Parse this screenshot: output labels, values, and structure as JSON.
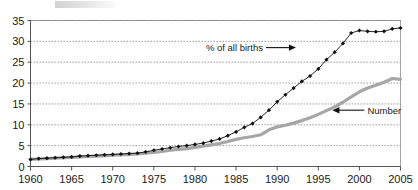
{
  "chart_data": {
    "type": "line",
    "title": "",
    "xlabel": "",
    "ylabel": "",
    "xlim": [
      1960,
      2005
    ],
    "ylim": [
      0,
      35
    ],
    "grid": true,
    "legend_position": "inline-annotations",
    "x": [
      1960,
      1961,
      1962,
      1963,
      1964,
      1965,
      1966,
      1967,
      1968,
      1969,
      1970,
      1971,
      1972,
      1973,
      1974,
      1975,
      1976,
      1977,
      1978,
      1979,
      1980,
      1981,
      1982,
      1983,
      1984,
      1985,
      1986,
      1987,
      1988,
      1989,
      1990,
      1991,
      1992,
      1993,
      1994,
      1995,
      1996,
      1997,
      1998,
      1999,
      2000,
      2001,
      2002,
      2003,
      2004,
      2005
    ],
    "x_tick_labels": [
      "1960",
      "1965",
      "1970",
      "1975",
      "1980",
      "1985",
      "1990",
      "1995",
      "2000",
      "2005"
    ],
    "x_ticks": [
      1960,
      1965,
      1970,
      1975,
      1980,
      1985,
      1990,
      1995,
      2000,
      2005
    ],
    "y_ticks": [
      0,
      5,
      10,
      15,
      20,
      25,
      30,
      35
    ],
    "y_tick_labels": [
      "0",
      "5",
      "10",
      "15",
      "20",
      "25",
      "30",
      "35"
    ],
    "series": [
      {
        "name": "% of all births",
        "marker": "diamond",
        "color": "#111111",
        "values": [
          1.7,
          1.9,
          2.0,
          2.1,
          2.2,
          2.3,
          2.5,
          2.6,
          2.7,
          2.8,
          2.9,
          3.0,
          3.1,
          3.2,
          3.5,
          3.9,
          4.2,
          4.5,
          4.8,
          5.0,
          5.3,
          5.6,
          6.1,
          6.6,
          7.4,
          8.3,
          9.4,
          10.3,
          11.8,
          13.5,
          15.5,
          17.2,
          18.8,
          20.4,
          21.7,
          23.4,
          25.6,
          27.4,
          29.5,
          32.0,
          32.6,
          32.4,
          32.3,
          32.4,
          33.0,
          33.2
        ]
      },
      {
        "name": "Number",
        "marker": "none",
        "color": "#a6a6a6",
        "values": [
          1.7,
          1.8,
          1.9,
          2.0,
          2.1,
          2.2,
          2.3,
          2.4,
          2.5,
          2.6,
          2.7,
          2.8,
          2.9,
          3.0,
          3.2,
          3.4,
          3.6,
          3.9,
          4.1,
          4.3,
          4.6,
          4.9,
          5.2,
          5.5,
          6.0,
          6.5,
          6.9,
          7.2,
          7.6,
          8.8,
          9.5,
          9.9,
          10.4,
          11.0,
          11.7,
          12.5,
          13.4,
          14.3,
          15.4,
          16.7,
          17.9,
          18.8,
          19.5,
          20.2,
          21.1,
          20.9
        ]
      }
    ],
    "annotations": [
      {
        "text": "% of all births",
        "target_series": "% of all births",
        "arrow": "right",
        "x": 1989,
        "y": 28.5
      },
      {
        "text": "Number",
        "target_series": "Number",
        "arrow": "left",
        "x": 2000,
        "y": 13.5
      }
    ]
  }
}
